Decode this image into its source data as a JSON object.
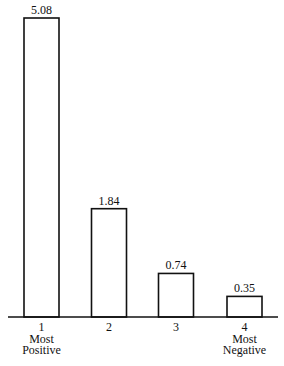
{
  "chart_data": {
    "type": "bar",
    "title": "",
    "xlabel": "",
    "ylabel": "",
    "categories": [
      "1",
      "2",
      "3",
      "4"
    ],
    "category_sublabels": [
      [
        "Most",
        "Positive"
      ],
      [],
      [],
      [
        "Most",
        "Negative"
      ]
    ],
    "values": [
      5.08,
      1.84,
      0.74,
      0.35
    ],
    "data_labels": [
      "5.08",
      "1.84",
      "0.74",
      "0.35"
    ],
    "ylim": [
      0,
      5.08
    ],
    "grid": false,
    "legend": "none"
  }
}
